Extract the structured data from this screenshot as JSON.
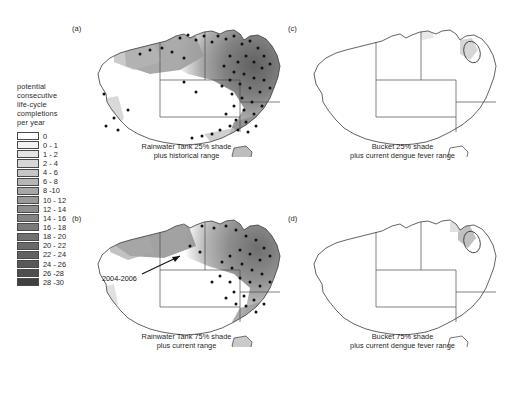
{
  "figure": {
    "legend": {
      "title": "potential\nconsecutive\nlife-cycle\ncompletions\nper year",
      "entries": [
        {
          "label": "0",
          "color": "#ffffff"
        },
        {
          "label": "0 - 1",
          "color": "#f2f2f2"
        },
        {
          "label": "1 - 2",
          "color": "#e4e4e4"
        },
        {
          "label": "2 - 4",
          "color": "#d6d6d6"
        },
        {
          "label": "4 - 6",
          "color": "#c6c6c6"
        },
        {
          "label": "6 - 8",
          "color": "#b6b6b6"
        },
        {
          "label": "8 -10",
          "color": "#a7a7a7"
        },
        {
          "label": "10 - 12",
          "color": "#9a9a9a"
        },
        {
          "label": "12 - 14",
          "color": "#8e8e8e"
        },
        {
          "label": "14 - 16",
          "color": "#848484"
        },
        {
          "label": "16 - 18",
          "color": "#7a7a7a"
        },
        {
          "label": "18 - 20",
          "color": "#717171"
        },
        {
          "label": "20 - 22",
          "color": "#696969"
        },
        {
          "label": "22 - 24",
          "color": "#616161"
        },
        {
          "label": "24 - 26",
          "color": "#585858"
        },
        {
          "label": "26 -28",
          "color": "#4e4e4e"
        },
        {
          "label": "28 -30",
          "color": "#3f3f3f"
        }
      ]
    },
    "panels": [
      {
        "id": "a",
        "label": "(a)",
        "caption": "Rainwater Tank 25% shade\nplus historical range",
        "shading": "extensive",
        "dots": true,
        "ellipse": false,
        "annotation": null
      },
      {
        "id": "b",
        "label": "(b)",
        "caption": "Rainwater Tank 75% shade\nplus current range",
        "shading": "moderate",
        "dots": true,
        "ellipse": false,
        "annotation": "2004-2006"
      },
      {
        "id": "c",
        "label": "(c)",
        "caption": "Bucket 25% shade\nplus current dengue fever range",
        "shading": "minimal",
        "dots": false,
        "ellipse": true,
        "annotation": null
      },
      {
        "id": "d",
        "label": "(d)",
        "caption": "Bucket 75% shade\nplus current dengue fever range",
        "shading": "minimal",
        "dots": false,
        "ellipse": true,
        "annotation": null
      }
    ]
  },
  "chart_data": {
    "type": "heatmap",
    "xlabel": "",
    "ylabel": "",
    "variable": "potential consecutive life-cycle completions per year",
    "units": "completions/year",
    "class_breaks": [
      0,
      1,
      2,
      4,
      6,
      8,
      10,
      12,
      14,
      16,
      18,
      20,
      22,
      24,
      26,
      28,
      30
    ],
    "class_labels": [
      "0",
      "0 - 1",
      "1 - 2",
      "2 - 4",
      "4 - 6",
      "6 - 8",
      "8 -10",
      "10 - 12",
      "12 - 14",
      "14 - 16",
      "16 - 18",
      "18 - 20",
      "20 - 22",
      "22 - 24",
      "24 - 26",
      "26 -28",
      "28 -30"
    ],
    "colors": [
      "#ffffff",
      "#f2f2f2",
      "#e4e4e4",
      "#d6d6d6",
      "#c6c6c6",
      "#b6b6b6",
      "#a7a7a7",
      "#9a9a9a",
      "#8e8e8e",
      "#848484",
      "#7a7a7a",
      "#717171",
      "#696969",
      "#616161",
      "#585858",
      "#4e4e4e",
      "#3f3f3f"
    ],
    "legend_position": "left",
    "grid": false,
    "panels": [
      {
        "id": "a",
        "label": "(a)",
        "title": "Rainwater Tank 25% shade plus historical range",
        "container": "Rainwater Tank",
        "shade_percent": 25,
        "range": "historical",
        "approx_suitable_area_fraction": 0.45,
        "max_class": "28 -30",
        "occurrence_points": true
      },
      {
        "id": "b",
        "label": "(b)",
        "title": "Rainwater Tank 75% shade plus current range",
        "container": "Rainwater Tank",
        "shade_percent": 75,
        "range": "current",
        "approx_suitable_area_fraction": 0.33,
        "max_class": "28 -30",
        "occurrence_points": true,
        "annotation": "2004-2006"
      },
      {
        "id": "c",
        "label": "(c)",
        "title": "Bucket 25% shade plus current dengue fever range",
        "container": "Bucket",
        "shade_percent": 25,
        "range": "current dengue fever",
        "approx_suitable_area_fraction": 0.02,
        "max_class": "2 - 4",
        "occurrence_points": false
      },
      {
        "id": "d",
        "label": "(d)",
        "title": "Bucket 75% shade plus current dengue fever range",
        "container": "Bucket",
        "shade_percent": 75,
        "range": "current dengue fever",
        "approx_suitable_area_fraction": 0.01,
        "max_class": "2 - 4",
        "occurrence_points": false
      }
    ]
  }
}
